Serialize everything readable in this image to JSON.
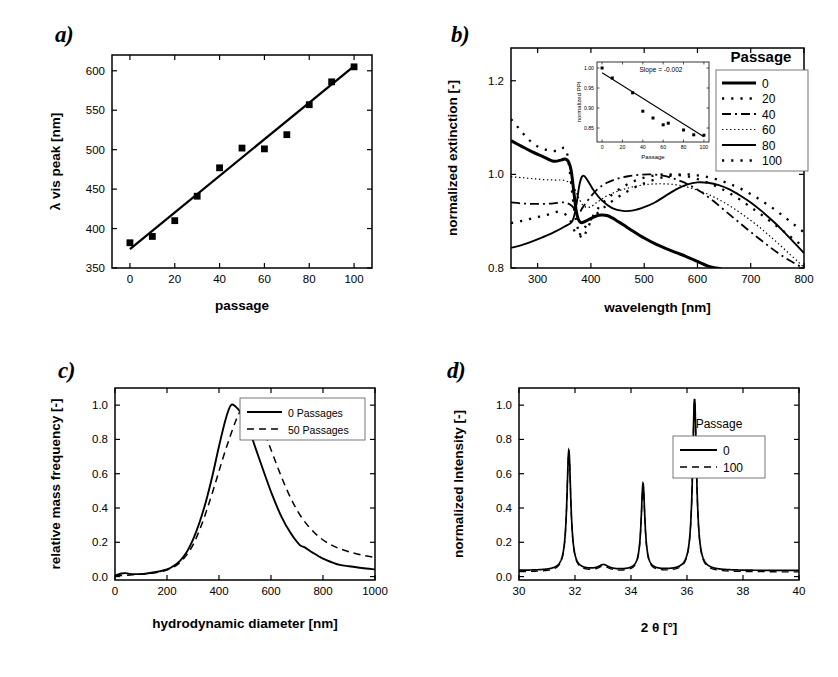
{
  "figure": {
    "panel_tags": {
      "a": "a)",
      "b": "b)",
      "c": "c)",
      "d": "d)"
    }
  },
  "chart_data": [
    {
      "id": "panel-a",
      "type": "scatter",
      "title": "",
      "xlabel": "passage",
      "ylabel": "λ vis peak [nm]",
      "xlim": [
        -8,
        108
      ],
      "ylim": [
        350,
        620
      ],
      "xticks": [
        0,
        20,
        40,
        60,
        80,
        100
      ],
      "xticklabels": [
        "0",
        "20",
        "40",
        "60",
        "80",
        "100"
      ],
      "yticks": [
        350,
        400,
        450,
        500,
        550,
        600
      ],
      "yticklabels": [
        "350",
        "400",
        "450",
        "500",
        "550",
        "600"
      ],
      "grid": false,
      "legend": null,
      "series": [
        {
          "name": "measured peak",
          "marker": "square",
          "x": [
            0,
            10,
            20,
            30,
            40,
            50,
            60,
            70,
            80,
            90,
            100
          ],
          "y": [
            382,
            390,
            410,
            441,
            477,
            502,
            501,
            519,
            557,
            586,
            605
          ]
        },
        {
          "name": "linear fit",
          "marker": "line",
          "x": [
            0,
            100
          ],
          "y": [
            374,
            606
          ]
        }
      ]
    },
    {
      "id": "panel-b",
      "type": "line",
      "title": "",
      "xlabel": "wavelength [nm]",
      "ylabel": "normalized extinction [-]",
      "xlim": [
        250,
        800
      ],
      "ylim": [
        0.8,
        1.27
      ],
      "xticks": [
        300,
        400,
        500,
        600,
        700,
        800
      ],
      "xticklabels": [
        "300",
        "400",
        "500",
        "600",
        "700",
        "800"
      ],
      "yticks": [
        0.8,
        1.0,
        1.2
      ],
      "yticklabels": [
        "0.8",
        "1.0",
        "1.2"
      ],
      "grid": false,
      "legend": {
        "title": "Passage",
        "position": "top-right",
        "entries": [
          {
            "label": "0",
            "style": "thick-solid"
          },
          {
            "label": "20",
            "style": "sparse-dotted"
          },
          {
            "label": "40",
            "style": "dash-dot"
          },
          {
            "label": "60",
            "style": "fine-dotted"
          },
          {
            "label": "80",
            "style": "solid"
          },
          {
            "label": "100",
            "style": "sparse-dotted"
          }
        ]
      },
      "series": [
        {
          "name": "0",
          "style": "thick-solid",
          "x": [
            250,
            270,
            290,
            310,
            330,
            345,
            352,
            358,
            363,
            368,
            372,
            376,
            380,
            384,
            390,
            400,
            410,
            420,
            430,
            440,
            450,
            460,
            480,
            500,
            520,
            540,
            560,
            580,
            600,
            620,
            635,
            645
          ],
          "y": [
            1.072,
            1.06,
            1.048,
            1.038,
            1.028,
            1.031,
            1.033,
            1.027,
            1.008,
            0.962,
            0.925,
            0.905,
            0.898,
            0.897,
            0.9,
            0.906,
            0.911,
            0.913,
            0.912,
            0.907,
            0.9,
            0.893,
            0.878,
            0.864,
            0.852,
            0.842,
            0.833,
            0.824,
            0.814,
            0.804,
            0.8,
            0.798
          ]
        },
        {
          "name": "20",
          "style": "sparse-dotted",
          "x": [
            250,
            265,
            280,
            295,
            310,
            325,
            340,
            355,
            370,
            382,
            392,
            405,
            420,
            440,
            460,
            480,
            500,
            520,
            540,
            560,
            580,
            600,
            620,
            640,
            660,
            680,
            700,
            720,
            740,
            760,
            780,
            800
          ],
          "y": [
            1.118,
            1.098,
            1.078,
            1.063,
            1.055,
            1.05,
            1.05,
            1.046,
            0.915,
            0.865,
            0.88,
            0.913,
            0.936,
            0.957,
            0.973,
            0.985,
            0.993,
            0.998,
            1.0,
            0.999,
            0.996,
            0.99,
            0.982,
            0.972,
            0.96,
            0.946,
            0.93,
            0.914,
            0.897,
            0.88,
            0.862,
            0.845
          ]
        },
        {
          "name": "40",
          "style": "dash-dot",
          "x": [
            250,
            270,
            290,
            310,
            330,
            350,
            365,
            375,
            385,
            398,
            412,
            430,
            450,
            470,
            490,
            510,
            530,
            550,
            570,
            590,
            610,
            630,
            650,
            670,
            690,
            710,
            730,
            750,
            770,
            790,
            800
          ],
          "y": [
            0.94,
            0.938,
            0.937,
            0.937,
            0.938,
            0.94,
            0.932,
            0.915,
            0.93,
            0.95,
            0.968,
            0.982,
            0.991,
            0.996,
            0.999,
            1.0,
            0.998,
            0.993,
            0.985,
            0.974,
            0.96,
            0.943,
            0.924,
            0.905,
            0.886,
            0.868,
            0.85,
            0.833,
            0.818,
            0.805,
            0.8
          ]
        },
        {
          "name": "60",
          "style": "fine-dotted",
          "x": [
            250,
            270,
            290,
            310,
            330,
            350,
            365,
            375,
            385,
            398,
            412,
            430,
            450,
            470,
            490,
            510,
            530,
            550,
            570,
            590,
            610,
            630,
            650,
            670,
            690,
            710,
            730,
            750,
            770,
            790,
            800
          ],
          "y": [
            0.995,
            0.993,
            0.991,
            0.989,
            0.988,
            0.987,
            0.978,
            0.955,
            0.934,
            0.93,
            0.941,
            0.954,
            0.964,
            0.971,
            0.976,
            0.979,
            0.98,
            0.979,
            0.976,
            0.97,
            0.962,
            0.952,
            0.94,
            0.926,
            0.91,
            0.893,
            0.874,
            0.854,
            0.833,
            0.812,
            0.801
          ]
        },
        {
          "name": "80",
          "style": "solid",
          "x": [
            250,
            270,
            290,
            310,
            330,
            350,
            365,
            372,
            378,
            383,
            388,
            395,
            405,
            420,
            440,
            460,
            480,
            500,
            520,
            540,
            560,
            580,
            600,
            620,
            640,
            660,
            680,
            700,
            720,
            740,
            760,
            780,
            800
          ],
          "y": [
            0.843,
            0.849,
            0.857,
            0.866,
            0.876,
            0.888,
            0.9,
            0.93,
            0.975,
            0.995,
            0.996,
            0.985,
            0.966,
            0.945,
            0.928,
            0.922,
            0.923,
            0.93,
            0.94,
            0.954,
            0.968,
            0.978,
            0.983,
            0.982,
            0.977,
            0.968,
            0.955,
            0.94,
            0.922,
            0.902,
            0.88,
            0.856,
            0.832
          ]
        },
        {
          "name": "100",
          "style": "sparse-dotted",
          "x": [
            250,
            268,
            286,
            304,
            322,
            340,
            358,
            374,
            388,
            402,
            420,
            440,
            460,
            480,
            500,
            520,
            540,
            560,
            580,
            600,
            620,
            640,
            660,
            680,
            700,
            720,
            740,
            760,
            780,
            800
          ],
          "y": [
            0.896,
            0.9,
            0.905,
            0.91,
            0.915,
            0.92,
            0.908,
            0.87,
            0.886,
            0.906,
            0.925,
            0.943,
            0.958,
            0.971,
            0.981,
            0.989,
            0.995,
            0.999,
            1.0,
            0.998,
            0.994,
            0.988,
            0.98,
            0.97,
            0.958,
            0.944,
            0.929,
            0.912,
            0.894,
            0.876
          ]
        }
      ],
      "inset": {
        "type": "scatter",
        "xlabel": "Passage",
        "ylabel": "normalized PPI",
        "annotation": "Slope = -0.002",
        "xlim": [
          -5,
          105
        ],
        "ylim": [
          0.815,
          1.015
        ],
        "xticks": [
          0,
          20,
          40,
          60,
          80,
          100
        ],
        "xticklabels": [
          "0",
          "20",
          "40",
          "60",
          "80",
          "100"
        ],
        "yticks": [
          0.85,
          0.9,
          0.95,
          1.0
        ],
        "yticklabels": [
          "0.85",
          "0.90",
          "0.95",
          "1.00"
        ],
        "series": [
          {
            "name": "normalized PPI",
            "marker": "square",
            "x": [
              0,
              10,
              30,
              40,
              50,
              60,
              65,
              80,
              90,
              100
            ],
            "y": [
              1.0,
              0.975,
              0.938,
              0.892,
              0.875,
              0.858,
              0.862,
              0.845,
              0.833,
              0.832
            ]
          },
          {
            "name": "linear fit",
            "marker": "line",
            "x": [
              0,
              100
            ],
            "y": [
              0.988,
              0.828
            ]
          }
        ]
      }
    },
    {
      "id": "panel-c",
      "type": "line",
      "title": "",
      "xlabel": "hydrodynamic diameter [nm]",
      "ylabel": "relative mass frequency [-]",
      "xlim": [
        0,
        1000
      ],
      "ylim": [
        -0.02,
        1.1
      ],
      "xticks": [
        0,
        200,
        400,
        600,
        800,
        1000
      ],
      "xticklabels": [
        "0",
        "200",
        "400",
        "600",
        "800",
        "1000"
      ],
      "yticks": [
        0.0,
        0.2,
        0.4,
        0.6,
        0.8,
        1.0
      ],
      "yticklabels": [
        "0.0",
        "0.2",
        "0.4",
        "0.6",
        "0.8",
        "1.0"
      ],
      "grid": false,
      "legend": {
        "title": "",
        "position": "top-right",
        "entries": [
          {
            "label": "0 Passages",
            "style": "solid"
          },
          {
            "label": "50 Passages",
            "style": "dashed"
          }
        ]
      },
      "series": [
        {
          "name": "0 Passages",
          "style": "solid",
          "x": [
            0,
            25,
            40,
            55,
            80,
            110,
            140,
            170,
            200,
            225,
            250,
            275,
            300,
            325,
            350,
            375,
            400,
            425,
            445,
            465,
            490,
            515,
            545,
            575,
            605,
            640,
            675,
            710,
            730,
            760,
            800,
            840,
            865,
            900,
            950,
            1000
          ],
          "y": [
            0.005,
            0.018,
            0.02,
            0.016,
            0.014,
            0.016,
            0.022,
            0.03,
            0.042,
            0.062,
            0.092,
            0.14,
            0.215,
            0.315,
            0.44,
            0.59,
            0.76,
            0.915,
            0.998,
            0.99,
            0.94,
            0.86,
            0.73,
            0.6,
            0.475,
            0.35,
            0.255,
            0.185,
            0.17,
            0.14,
            0.105,
            0.08,
            0.068,
            0.06,
            0.05,
            0.042
          ]
        },
        {
          "name": "50 Passages",
          "style": "dashed",
          "x": [
            0,
            50,
            100,
            140,
            180,
            210,
            240,
            270,
            300,
            330,
            360,
            390,
            415,
            440,
            465,
            485,
            500,
            515,
            535,
            560,
            590,
            620,
            650,
            685,
            720,
            755,
            790,
            825,
            860,
            900,
            950,
            1000
          ],
          "y": [
            0.004,
            0.008,
            0.014,
            0.02,
            0.03,
            0.045,
            0.07,
            0.115,
            0.185,
            0.29,
            0.42,
            0.565,
            0.69,
            0.805,
            0.91,
            0.975,
            1.0,
            0.995,
            0.96,
            0.89,
            0.78,
            0.66,
            0.545,
            0.43,
            0.34,
            0.275,
            0.225,
            0.19,
            0.165,
            0.145,
            0.125,
            0.112
          ]
        }
      ]
    },
    {
      "id": "panel-d",
      "type": "line",
      "title": "",
      "xlabel": "2 θ [°]",
      "ylabel": "normalized Intensity [-]",
      "xlim": [
        30,
        40
      ],
      "ylim": [
        -0.02,
        1.1
      ],
      "xticks": [
        30,
        32,
        34,
        36,
        38,
        40
      ],
      "xticklabels": [
        "30",
        "32",
        "34",
        "36",
        "38",
        "40"
      ],
      "yticks": [
        0.0,
        0.2,
        0.4,
        0.6,
        0.8,
        1.0
      ],
      "yticklabels": [
        "0.0",
        "0.2",
        "0.4",
        "0.6",
        "0.8",
        "1.0"
      ],
      "grid": false,
      "legend": {
        "title": "Passage",
        "position": "top-right",
        "entries": [
          {
            "label": "0",
            "style": "solid"
          },
          {
            "label": "100",
            "style": "dashed"
          }
        ]
      },
      "peaks": [
        {
          "center": 31.78,
          "height": 0.7,
          "width": 0.085
        },
        {
          "center": 33.02,
          "height": 0.03,
          "width": 0.22
        },
        {
          "center": 34.43,
          "height": 0.505,
          "width": 0.08
        },
        {
          "center": 36.27,
          "height": 1.0,
          "width": 0.085
        }
      ],
      "baseline": 0.035,
      "series": [
        {
          "name": "0",
          "style": "solid"
        },
        {
          "name": "100",
          "style": "dashed"
        }
      ]
    }
  ]
}
